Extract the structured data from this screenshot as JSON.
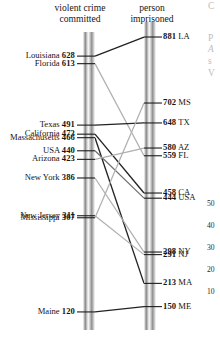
{
  "figure": {
    "left_header_line1": "violent crime",
    "left_header_line2": "committed",
    "right_header_line1": "person",
    "right_header_line2": "imprisoned"
  },
  "axis_ticks_right": [
    "50",
    "40",
    "30",
    "20",
    "10"
  ],
  "edge_fragments": [
    "C",
    "P",
    "A",
    "s",
    "V",
    "3",
    "2"
  ],
  "chart_data": {
    "type": "line",
    "subtype": "slopegraph",
    "title": "",
    "left_axis_label": "violent crime committed",
    "right_axis_label": "person imprisoned",
    "left_ticks": [
      {
        "label": "Louisiana",
        "value": 628
      },
      {
        "label": "Florida",
        "value": 613
      },
      {
        "label": "Texas",
        "value": 491
      },
      {
        "label": "California",
        "value": 473
      },
      {
        "label": "Massachusetts",
        "value": 466
      },
      {
        "label": "USA",
        "value": 440
      },
      {
        "label": "Arizona",
        "value": 423
      },
      {
        "label": "New York",
        "value": 386
      },
      {
        "label": "New Jersey",
        "value": 311
      },
      {
        "label": "Mississippi",
        "value": 307
      },
      {
        "label": "Maine",
        "value": 120
      }
    ],
    "right_ticks": [
      {
        "label": "LA",
        "value": 881
      },
      {
        "label": "MS",
        "value": 702
      },
      {
        "label": "TX",
        "value": 648
      },
      {
        "label": "AZ",
        "value": 580
      },
      {
        "label": "FL",
        "value": 559
      },
      {
        "label": "CA",
        "value": 458
      },
      {
        "label": "USA",
        "value": 444
      },
      {
        "label": "NY",
        "value": 298
      },
      {
        "label": "NJ",
        "value": 291
      },
      {
        "label": "MA",
        "value": 213
      },
      {
        "label": "ME",
        "value": 150
      }
    ],
    "series": [
      {
        "name": "Louisiana",
        "code": "LA",
        "left": 628,
        "right": 881,
        "tone": "dark"
      },
      {
        "name": "Florida",
        "code": "FL",
        "left": 613,
        "right": 559,
        "tone": "light"
      },
      {
        "name": "Texas",
        "code": "TX",
        "left": 491,
        "right": 648,
        "tone": "dark"
      },
      {
        "name": "California",
        "code": "CA",
        "left": 473,
        "right": 458,
        "tone": "dark"
      },
      {
        "name": "Massachusetts",
        "code": "MA",
        "left": 466,
        "right": 213,
        "tone": "dark"
      },
      {
        "name": "USA",
        "code": "USA",
        "left": 440,
        "right": 444,
        "tone": "mid"
      },
      {
        "name": "Arizona",
        "code": "AZ",
        "left": 423,
        "right": 580,
        "tone": "light"
      },
      {
        "name": "New York",
        "code": "NY",
        "left": 386,
        "right": 298,
        "tone": "light"
      },
      {
        "name": "New Jersey",
        "code": "NJ",
        "left": 311,
        "right": 291,
        "tone": "light"
      },
      {
        "name": "Mississippi",
        "code": "MS",
        "left": 307,
        "right": 702,
        "tone": "light"
      },
      {
        "name": "Maine",
        "code": "ME",
        "left": 120,
        "right": 150,
        "tone": "dark"
      }
    ],
    "ylim_left": [
      100,
      660
    ],
    "ylim_right": [
      130,
      900
    ],
    "grid": false,
    "legend": "none"
  }
}
